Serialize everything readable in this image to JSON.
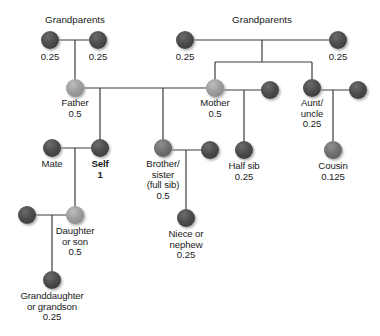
{
  "diagram": {
    "colors": {
      "dark_node": "#4a4a4a",
      "mid_node": "#6d6d6d",
      "light_node": "#9a9a9a",
      "line": "#3c3c3c",
      "text": "#1a1a1a",
      "background": "#ffffff"
    },
    "headers": [
      {
        "id": "grandparents-left",
        "text": "Grandparents",
        "x": 75,
        "y": 14
      },
      {
        "id": "grandparents-right",
        "text": "Grandparents",
        "x": 262,
        "y": 14
      }
    ],
    "nodes": [
      {
        "id": "grandparent-paternal-1",
        "label": "",
        "coef": "0.25",
        "x": 50,
        "y": 40,
        "r": 9,
        "shade": "dark",
        "label_pos": "below",
        "coef_only": true
      },
      {
        "id": "grandparent-paternal-2",
        "label": "",
        "coef": "0.25",
        "x": 98,
        "y": 40,
        "r": 9,
        "shade": "dark",
        "label_pos": "below",
        "coef_only": true
      },
      {
        "id": "grandparent-maternal-1",
        "label": "",
        "coef": "0.25",
        "x": 185,
        "y": 40,
        "r": 9,
        "shade": "dark",
        "label_pos": "below",
        "coef_only": true
      },
      {
        "id": "grandparent-maternal-2",
        "label": "",
        "coef": "0.25",
        "x": 338,
        "y": 40,
        "r": 9,
        "shade": "dark",
        "label_pos": "below",
        "coef_only": true
      },
      {
        "id": "father",
        "label": "Father",
        "coef": "0.5",
        "x": 75,
        "y": 88,
        "r": 9,
        "shade": "light"
      },
      {
        "id": "mother",
        "label": "Mother",
        "coef": "0.5",
        "x": 215,
        "y": 88,
        "r": 9,
        "shade": "light"
      },
      {
        "id": "mother-mate",
        "label": "",
        "coef": "",
        "x": 270,
        "y": 90,
        "r": 9,
        "shade": "dark"
      },
      {
        "id": "aunt-uncle",
        "label": "Aunt/\nuncle",
        "coef": "0.25",
        "x": 312,
        "y": 88,
        "r": 9,
        "shade": "dark"
      },
      {
        "id": "aunt-uncle-mate",
        "label": "",
        "coef": "",
        "x": 358,
        "y": 90,
        "r": 9,
        "shade": "dark"
      },
      {
        "id": "mate",
        "label": "Mate",
        "coef": "",
        "x": 52,
        "y": 148,
        "r": 9,
        "shade": "dark"
      },
      {
        "id": "self",
        "label": "Self",
        "coef": "1",
        "x": 100,
        "y": 148,
        "r": 9,
        "shade": "dark",
        "bold": true
      },
      {
        "id": "brother-sister",
        "label": "Brother/\nsister\n(full sib)",
        "coef": "0.5",
        "x": 163,
        "y": 148,
        "r": 9,
        "shade": "mid"
      },
      {
        "id": "brother-sister-mate",
        "label": "",
        "coef": "",
        "x": 210,
        "y": 150,
        "r": 9,
        "shade": "dark"
      },
      {
        "id": "half-sib",
        "label": "Half sib",
        "coef": "0.25",
        "x": 244,
        "y": 150,
        "r": 9,
        "shade": "dark"
      },
      {
        "id": "cousin",
        "label": "Cousin",
        "coef": "0.125",
        "x": 333,
        "y": 150,
        "r": 9,
        "shade": "mid"
      },
      {
        "id": "daughter-son-mate",
        "label": "",
        "coef": "",
        "x": 27,
        "y": 215,
        "r": 9,
        "shade": "dark"
      },
      {
        "id": "daughter-son",
        "label": "Daughter\nor son",
        "coef": "0.5",
        "x": 75,
        "y": 215,
        "r": 9,
        "shade": "light"
      },
      {
        "id": "niece-nephew",
        "label": "Niece or\nnephew",
        "coef": "0.25",
        "x": 186,
        "y": 218,
        "r": 9,
        "shade": "dark"
      },
      {
        "id": "granddaughter-grandson",
        "label": "Granddaughter\nor grandson",
        "coef": "0.25",
        "x": 52,
        "y": 280,
        "r": 9,
        "shade": "dark"
      }
    ],
    "labels": [
      {
        "for": "grandparent-paternal-1",
        "text": "0.25",
        "x": 50,
        "y": 52
      },
      {
        "for": "grandparent-paternal-2",
        "text": "0.25",
        "x": 98,
        "y": 52
      },
      {
        "for": "grandparent-maternal-1",
        "text": "0.25",
        "x": 185,
        "y": 52
      },
      {
        "for": "grandparent-maternal-2",
        "text": "0.25",
        "x": 338,
        "y": 52
      },
      {
        "for": "father",
        "text": "Father\n0.5",
        "x": 75,
        "y": 98
      },
      {
        "for": "mother",
        "text": "Mother\n0.5",
        "x": 215,
        "y": 98
      },
      {
        "for": "aunt-uncle",
        "text": "Aunt/\nuncle\n0.25",
        "x": 312,
        "y": 98
      },
      {
        "for": "mate",
        "text": "Mate",
        "x": 52,
        "y": 159
      },
      {
        "for": "self",
        "text": "Self",
        "x": 100,
        "y": 159,
        "bold": true
      },
      {
        "for": "self-coef",
        "text": "1",
        "x": 100,
        "y": 170,
        "bold": true
      },
      {
        "for": "brother-sister",
        "text": "Brother/\nsister\n(full sib)\n0.5",
        "x": 163,
        "y": 159
      },
      {
        "for": "half-sib",
        "text": "Half sib\n0.25",
        "x": 244,
        "y": 161
      },
      {
        "for": "cousin",
        "text": "Cousin\n0.125",
        "x": 333,
        "y": 161
      },
      {
        "for": "daughter-son",
        "text": "Daughter\nor son\n0.5",
        "x": 75,
        "y": 226
      },
      {
        "for": "niece-nephew",
        "text": "Niece or\nnephew\n0.25",
        "x": 186,
        "y": 229
      },
      {
        "for": "granddaughter-grandson",
        "text": "Granddaughter\nor grandson\n0.25",
        "x": 52,
        "y": 291
      }
    ],
    "edges": [
      {
        "id": "gp-left-union",
        "type": "h",
        "x1": 50,
        "x2": 98,
        "y": 40
      },
      {
        "id": "gp-left-drop",
        "type": "v",
        "x": 75,
        "y1": 40,
        "y2": 88
      },
      {
        "id": "gp-right-union",
        "type": "h",
        "x1": 185,
        "x2": 338,
        "y": 40
      },
      {
        "id": "gp-right-drop",
        "type": "v",
        "x": 262,
        "y1": 40,
        "y2": 62
      },
      {
        "id": "gp-right-sibline",
        "type": "h",
        "x1": 215,
        "x2": 312,
        "y": 62
      },
      {
        "id": "mother-drop",
        "type": "v",
        "x": 215,
        "y1": 62,
        "y2": 88
      },
      {
        "id": "aunt-drop",
        "type": "v",
        "x": 312,
        "y1": 62,
        "y2": 88
      },
      {
        "id": "father-mother-union",
        "type": "h",
        "x1": 75,
        "x2": 215,
        "y": 88
      },
      {
        "id": "self-drop",
        "type": "v",
        "x": 100,
        "y1": 88,
        "y2": 148
      },
      {
        "id": "sib-drop",
        "type": "v",
        "x": 163,
        "y1": 88,
        "y2": 148
      },
      {
        "id": "mother-mate-union",
        "type": "h",
        "x1": 215,
        "x2": 270,
        "y": 90
      },
      {
        "id": "halfsib-drop",
        "type": "v",
        "x": 244,
        "y1": 90,
        "y2": 150
      },
      {
        "id": "aunt-mate-union",
        "type": "h",
        "x1": 312,
        "x2": 358,
        "y": 90
      },
      {
        "id": "cousin-drop",
        "type": "v",
        "x": 333,
        "y1": 90,
        "y2": 150
      },
      {
        "id": "self-mate-union",
        "type": "h",
        "x1": 52,
        "x2": 100,
        "y": 148
      },
      {
        "id": "daughter-drop",
        "type": "v",
        "x": 75,
        "y1": 148,
        "y2": 215
      },
      {
        "id": "sib-mate-union",
        "type": "h",
        "x1": 163,
        "x2": 210,
        "y": 150
      },
      {
        "id": "niece-drop",
        "type": "v",
        "x": 186,
        "y1": 150,
        "y2": 218
      },
      {
        "id": "daughter-mate-union",
        "type": "h",
        "x1": 27,
        "x2": 75,
        "y": 215
      },
      {
        "id": "grandchild-drop",
        "type": "v",
        "x": 52,
        "y1": 215,
        "y2": 280
      }
    ]
  }
}
